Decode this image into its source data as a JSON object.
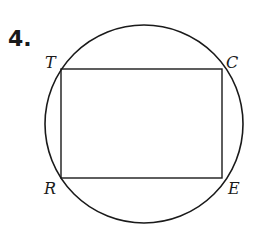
{
  "problem": {
    "number": "4."
  },
  "diagram": {
    "circle": {
      "cx": 144,
      "cy": 124,
      "r": 99
    },
    "rectangle": {
      "x": 61,
      "y": 69,
      "width": 161,
      "height": 109
    },
    "vertices": [
      {
        "name": "T",
        "x": 61,
        "y": 69
      },
      {
        "name": "C",
        "x": 222,
        "y": 69
      },
      {
        "name": "E",
        "x": 222,
        "y": 178
      },
      {
        "name": "R",
        "x": 61,
        "y": 178
      }
    ],
    "labels": {
      "T": "T",
      "C": "C",
      "E": "E",
      "R": "R"
    },
    "stroke_color": "#1a1a1a"
  }
}
